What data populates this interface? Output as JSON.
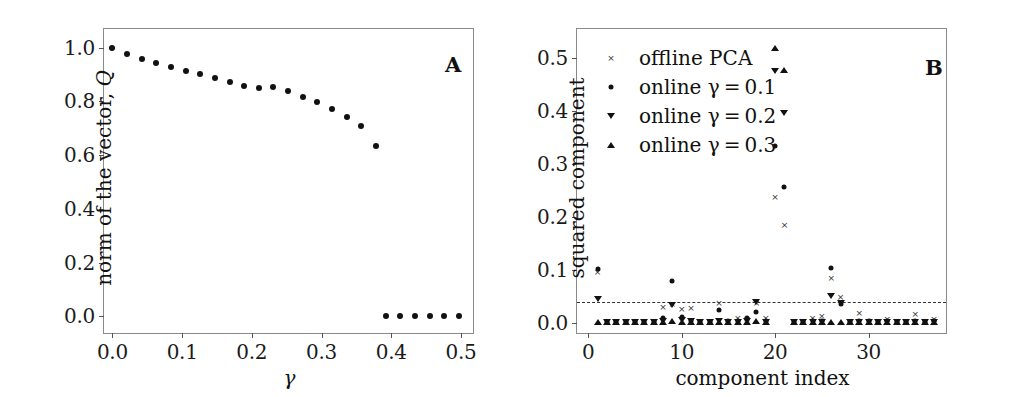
{
  "figure": {
    "panels": [
      "A",
      "B"
    ]
  },
  "panel_a": {
    "letter": "A",
    "ylabel_text": "norm of the vector, ",
    "ylabel_symbol": "Q",
    "xlabel_symbol": "γ",
    "yticks": [
      "0.0",
      "0.2",
      "0.4",
      "0.6",
      "0.8",
      "1.0"
    ],
    "xticks": [
      "0.0",
      "0.1",
      "0.2",
      "0.3",
      "0.4",
      "0.5"
    ]
  },
  "panel_b": {
    "letter": "B",
    "ylabel": "squared component",
    "xlabel": "component index",
    "yticks": [
      "0.0",
      "0.1",
      "0.2",
      "0.3",
      "0.4",
      "0.5"
    ],
    "xticks": [
      "0",
      "10",
      "20",
      "30"
    ],
    "legend": [
      {
        "marker": "cross",
        "label": "offline PCA"
      },
      {
        "marker": "dot",
        "label": "online γ = 0.1"
      },
      {
        "marker": "tri-down",
        "label": "online γ = 0.2"
      },
      {
        "marker": "tri-up",
        "label": "online γ = 0.3"
      }
    ]
  },
  "chart_data": [
    {
      "id": "panel-a",
      "type": "scatter",
      "title": "A",
      "xlabel": "γ",
      "ylabel": "norm of the vector, Q",
      "xlim": [
        -0.012,
        0.52
      ],
      "ylim": [
        -0.07,
        1.07
      ],
      "grid": false,
      "legend": "none",
      "series": [
        {
          "name": "norm of the vector Q",
          "marker": "dot",
          "x": [
            0.0,
            0.021,
            0.042,
            0.063,
            0.084,
            0.105,
            0.126,
            0.147,
            0.168,
            0.189,
            0.21,
            0.231,
            0.252,
            0.273,
            0.294,
            0.315,
            0.336,
            0.357,
            0.378,
            0.392,
            0.413,
            0.434,
            0.455,
            0.476,
            0.497
          ],
          "y": [
            1.0,
            0.978,
            0.96,
            0.944,
            0.927,
            0.914,
            0.901,
            0.886,
            0.872,
            0.859,
            0.849,
            0.855,
            0.839,
            0.818,
            0.797,
            0.772,
            0.742,
            0.707,
            0.635,
            0.0,
            0.0,
            0.0,
            0.0,
            0.0,
            0.0
          ]
        }
      ]
    },
    {
      "id": "panel-b",
      "type": "scatter",
      "title": "B",
      "xlabel": "component index",
      "ylabel": "squared component",
      "xlim": [
        -1.2,
        38.5
      ],
      "ylim": [
        -0.022,
        0.555
      ],
      "grid": false,
      "legend": "upper-left",
      "threshold_line": {
        "value": 0.04,
        "style": "dashed"
      },
      "series": [
        {
          "name": "offline PCA",
          "marker": "cross",
          "x": [
            1,
            2,
            3,
            4,
            5,
            6,
            7,
            8,
            9,
            10,
            11,
            12,
            13,
            14,
            15,
            16,
            17,
            18,
            19,
            20,
            21,
            22,
            23,
            24,
            25,
            26,
            27,
            28,
            29,
            30,
            31,
            32,
            33,
            34,
            35,
            36,
            37
          ],
          "y": [
            0.096,
            0.003,
            0.002,
            0.003,
            0.002,
            0.003,
            0.004,
            0.03,
            0.037,
            0.027,
            0.028,
            0.004,
            0.003,
            0.038,
            0.004,
            0.01,
            0.009,
            0.038,
            0.011,
            0.238,
            0.185,
            0.003,
            0.004,
            0.011,
            0.013,
            0.086,
            0.05,
            0.004,
            0.019,
            0.005,
            0.004,
            0.009,
            0.004,
            0.005,
            0.018,
            0.004,
            0.008
          ]
        },
        {
          "name": "online γ = 0.1",
          "marker": "dot",
          "x": [
            1,
            2,
            3,
            4,
            5,
            6,
            7,
            8,
            9,
            10,
            11,
            12,
            13,
            14,
            15,
            16,
            17,
            18,
            19,
            20,
            21,
            22,
            23,
            24,
            25,
            26,
            27,
            28,
            29,
            30,
            31,
            32,
            33,
            34,
            35,
            36,
            37
          ],
          "y": [
            0.102,
            0.002,
            0.002,
            0.002,
            0.002,
            0.002,
            0.003,
            0.01,
            0.079,
            0.012,
            0.004,
            0.003,
            0.002,
            0.026,
            0.004,
            0.004,
            0.01,
            0.021,
            0.004,
            0.335,
            0.257,
            0.002,
            0.003,
            0.004,
            0.004,
            0.104,
            0.037,
            0.003,
            0.004,
            0.004,
            0.003,
            0.004,
            0.003,
            0.003,
            0.004,
            0.003,
            0.004
          ]
        },
        {
          "name": "online γ = 0.2",
          "marker": "tri-down",
          "x": [
            1,
            2,
            3,
            4,
            5,
            6,
            7,
            8,
            9,
            10,
            11,
            12,
            13,
            14,
            15,
            16,
            17,
            18,
            19,
            20,
            21,
            22,
            23,
            24,
            25,
            26,
            27,
            28,
            29,
            30,
            31,
            32,
            33,
            34,
            35,
            36,
            37
          ],
          "y": [
            0.046,
            0.002,
            0.002,
            0.002,
            0.002,
            0.002,
            0.003,
            0.005,
            0.035,
            0.006,
            0.004,
            0.003,
            0.002,
            0.004,
            0.003,
            0.003,
            0.004,
            0.04,
            0.003,
            0.475,
            0.397,
            0.002,
            0.003,
            0.003,
            0.003,
            0.052,
            0.038,
            0.003,
            0.003,
            0.003,
            0.003,
            0.003,
            0.003,
            0.003,
            0.003,
            0.003,
            0.003
          ]
        },
        {
          "name": "online γ = 0.3",
          "marker": "tri-up",
          "x": [
            1,
            2,
            3,
            4,
            5,
            6,
            7,
            8,
            9,
            10,
            11,
            12,
            13,
            14,
            15,
            16,
            17,
            18,
            19,
            20,
            21,
            22,
            23,
            24,
            25,
            26,
            27,
            28,
            29,
            30,
            31,
            32,
            33,
            34,
            35,
            36,
            37
          ],
          "y": [
            0.003,
            0.002,
            0.002,
            0.002,
            0.002,
            0.002,
            0.002,
            0.003,
            0.004,
            0.003,
            0.003,
            0.002,
            0.002,
            0.003,
            0.002,
            0.002,
            0.003,
            0.004,
            0.002,
            0.52,
            0.478,
            0.002,
            0.002,
            0.002,
            0.002,
            0.003,
            0.003,
            0.002,
            0.003,
            0.002,
            0.002,
            0.002,
            0.002,
            0.002,
            0.002,
            0.002,
            0.002
          ]
        }
      ]
    }
  ]
}
